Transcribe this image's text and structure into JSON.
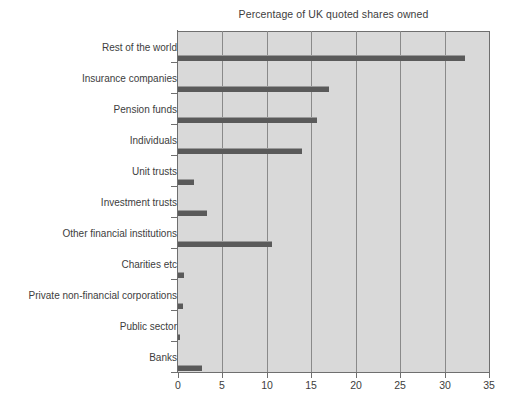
{
  "chart_data": {
    "type": "bar",
    "orientation": "horizontal",
    "title": "Percentage of UK quoted shares owned",
    "xlabel": "",
    "ylabel": "",
    "xlim": [
      0,
      35
    ],
    "xticks": [
      0,
      5,
      10,
      15,
      20,
      25,
      30,
      35
    ],
    "grid": true,
    "legend": "none",
    "plot_background": "#d9d9d9",
    "bar_color": "#5a5a5a",
    "categories": [
      "Rest of the world",
      "Insurance companies",
      "Pension funds",
      "Individuals",
      "Unit trusts",
      "Investment trusts",
      "Other financial institutions",
      "Charities etc",
      "Private non-financial corporations",
      "Public sector",
      "Banks"
    ],
    "values": [
      32.3,
      17.0,
      15.6,
      14.0,
      1.8,
      3.3,
      10.6,
      0.7,
      0.6,
      0.2,
      2.7
    ]
  }
}
